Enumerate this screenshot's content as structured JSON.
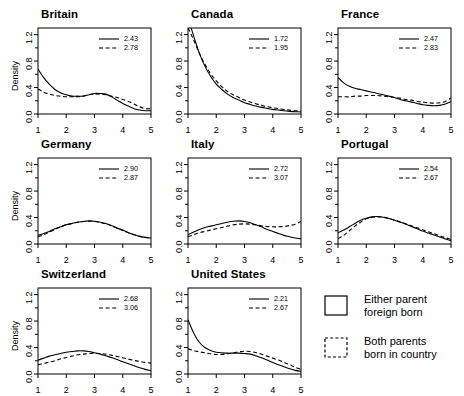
{
  "figure": {
    "layout": "3x3 small multiples",
    "panel_order": [
      "Britain",
      "Canada",
      "France",
      "Germany",
      "Italy",
      "Portugal",
      "Switzerland",
      "United States"
    ],
    "ylabel": "Density",
    "y_ticks": [
      "0.0",
      "0.4",
      "0.8",
      "1.2"
    ],
    "x_ticks": [
      "1",
      "2",
      "3",
      "4",
      "5"
    ]
  },
  "key": {
    "solid_label_line1": "Either parent",
    "solid_label_line2": "foreign born",
    "dashed_label_line1": "Both parents",
    "dashed_label_line2": "born in country"
  },
  "panels": [
    {
      "title": "Britain",
      "solid_value": "2.43",
      "dashed_value": "2.78"
    },
    {
      "title": "Canada",
      "solid_value": "1.72",
      "dashed_value": "1.95"
    },
    {
      "title": "France",
      "solid_value": "2.47",
      "dashed_value": "2.83"
    },
    {
      "title": "Germany",
      "solid_value": "2.90",
      "dashed_value": "2.87"
    },
    {
      "title": "Italy",
      "solid_value": "2.72",
      "dashed_value": "3.07"
    },
    {
      "title": "Portugal",
      "solid_value": "2.54",
      "dashed_value": "2.67"
    },
    {
      "title": "Switzerland",
      "solid_value": "2.68",
      "dashed_value": "3.06"
    },
    {
      "title": "United States",
      "solid_value": "2.21",
      "dashed_value": "2.67"
    }
  ],
  "chart_data": {
    "type": "line",
    "title": "",
    "xlabel": "",
    "ylabel": "Density",
    "xlim": [
      1,
      5
    ],
    "ylim": [
      0,
      1.3
    ],
    "x_ticks": [
      1,
      2,
      3,
      4,
      5
    ],
    "y_ticks": [
      0.0,
      0.4,
      0.8,
      1.2
    ],
    "grid": false,
    "legend_position": "inside-top-right (per panel, numeric means)",
    "series_names": [
      "Either parent foreign born",
      "Both parents born in country"
    ],
    "x": [
      1.0,
      1.2,
      1.4,
      1.6,
      1.8,
      2.0,
      2.2,
      2.4,
      2.6,
      2.8,
      3.0,
      3.2,
      3.4,
      3.6,
      3.8,
      4.0,
      4.2,
      4.4,
      4.6,
      4.8,
      5.0
    ],
    "panels": [
      {
        "title": "Britain",
        "mean_solid": 2.43,
        "mean_dashed": 2.78,
        "series": [
          {
            "name": "Either parent foreign born",
            "style": "solid",
            "values": [
              0.68,
              0.55,
              0.45,
              0.37,
              0.32,
              0.29,
              0.27,
              0.27,
              0.27,
              0.29,
              0.31,
              0.31,
              0.3,
              0.26,
              0.21,
              0.16,
              0.12,
              0.08,
              0.06,
              0.05,
              0.05
            ]
          },
          {
            "name": "Both parents born in country",
            "style": "dashed",
            "values": [
              0.38,
              0.33,
              0.3,
              0.28,
              0.27,
              0.26,
              0.26,
              0.26,
              0.27,
              0.29,
              0.3,
              0.3,
              0.29,
              0.27,
              0.25,
              0.22,
              0.19,
              0.15,
              0.11,
              0.08,
              0.08
            ]
          }
        ]
      },
      {
        "title": "Canada",
        "mean_solid": 1.72,
        "mean_dashed": 1.95,
        "series": [
          {
            "name": "Either parent foreign born",
            "style": "solid",
            "values": [
              1.45,
              1.18,
              0.92,
              0.72,
              0.57,
              0.45,
              0.37,
              0.3,
              0.25,
              0.21,
              0.17,
              0.145,
              0.12,
              0.1,
              0.085,
              0.07,
              0.06,
              0.05,
              0.04,
              0.035,
              0.03
            ]
          },
          {
            "name": "Both parents born in country",
            "style": "dashed",
            "values": [
              1.3,
              1.12,
              0.92,
              0.75,
              0.61,
              0.5,
              0.41,
              0.34,
              0.29,
              0.25,
              0.21,
              0.18,
              0.155,
              0.13,
              0.11,
              0.095,
              0.08,
              0.068,
              0.058,
              0.05,
              0.045
            ]
          }
        ]
      },
      {
        "title": "France",
        "mean_solid": 2.47,
        "mean_dashed": 2.83,
        "series": [
          {
            "name": "Either parent foreign born",
            "style": "solid",
            "values": [
              0.55,
              0.47,
              0.42,
              0.39,
              0.37,
              0.35,
              0.33,
              0.31,
              0.29,
              0.27,
              0.25,
              0.22,
              0.2,
              0.18,
              0.16,
              0.14,
              0.13,
              0.125,
              0.13,
              0.15,
              0.19
            ]
          },
          {
            "name": "Both parents born in country",
            "style": "dashed",
            "values": [
              0.26,
              0.26,
              0.26,
              0.27,
              0.27,
              0.28,
              0.28,
              0.28,
              0.27,
              0.26,
              0.25,
              0.24,
              0.22,
              0.21,
              0.19,
              0.18,
              0.17,
              0.165,
              0.17,
              0.19,
              0.24
            ]
          }
        ]
      },
      {
        "title": "Germany",
        "mean_solid": 2.9,
        "mean_dashed": 2.87,
        "series": [
          {
            "name": "Either parent foreign born",
            "style": "solid",
            "values": [
              0.13,
              0.16,
              0.19,
              0.23,
              0.26,
              0.29,
              0.31,
              0.33,
              0.34,
              0.35,
              0.345,
              0.33,
              0.31,
              0.28,
              0.24,
              0.21,
              0.17,
              0.14,
              0.115,
              0.1,
              0.09
            ]
          },
          {
            "name": "Both parents born in country",
            "style": "dashed",
            "values": [
              0.11,
              0.14,
              0.18,
              0.22,
              0.26,
              0.29,
              0.31,
              0.33,
              0.34,
              0.345,
              0.34,
              0.325,
              0.305,
              0.275,
              0.24,
              0.205,
              0.17,
              0.14,
              0.115,
              0.1,
              0.09
            ]
          }
        ]
      },
      {
        "title": "Italy",
        "mean_solid": 2.72,
        "mean_dashed": 3.07,
        "series": [
          {
            "name": "Either parent foreign born",
            "style": "solid",
            "values": [
              0.14,
              0.18,
              0.22,
              0.25,
              0.27,
              0.29,
              0.31,
              0.33,
              0.345,
              0.35,
              0.34,
              0.32,
              0.29,
              0.26,
              0.22,
              0.19,
              0.16,
              0.13,
              0.11,
              0.09,
              0.08
            ]
          },
          {
            "name": "Both parents born in country",
            "style": "dashed",
            "values": [
              0.11,
              0.14,
              0.17,
              0.19,
              0.21,
              0.23,
              0.25,
              0.27,
              0.29,
              0.3,
              0.305,
              0.3,
              0.29,
              0.275,
              0.265,
              0.26,
              0.26,
              0.265,
              0.28,
              0.3,
              0.34
            ]
          }
        ]
      },
      {
        "title": "Portugal",
        "mean_solid": 2.54,
        "mean_dashed": 2.67,
        "series": [
          {
            "name": "Either parent foreign born",
            "style": "solid",
            "values": [
              0.17,
              0.21,
              0.26,
              0.31,
              0.36,
              0.39,
              0.41,
              0.415,
              0.405,
              0.385,
              0.36,
              0.33,
              0.3,
              0.265,
              0.23,
              0.195,
              0.165,
              0.135,
              0.105,
              0.075,
              0.05
            ]
          },
          {
            "name": "Both parents born in country",
            "style": "dashed",
            "values": [
              0.08,
              0.13,
              0.2,
              0.27,
              0.33,
              0.38,
              0.405,
              0.41,
              0.405,
              0.385,
              0.36,
              0.335,
              0.305,
              0.275,
              0.245,
              0.215,
              0.185,
              0.155,
              0.125,
              0.095,
              0.07
            ]
          }
        ]
      },
      {
        "title": "Switzerland",
        "mean_solid": 2.68,
        "mean_dashed": 3.06,
        "series": [
          {
            "name": "Either parent foreign born",
            "style": "solid",
            "values": [
              0.21,
              0.24,
              0.27,
              0.29,
              0.31,
              0.33,
              0.34,
              0.35,
              0.35,
              0.34,
              0.32,
              0.3,
              0.275,
              0.25,
              0.22,
              0.185,
              0.155,
              0.125,
              0.095,
              0.07,
              0.05
            ]
          },
          {
            "name": "Both parents born in country",
            "style": "dashed",
            "values": [
              0.14,
              0.16,
              0.18,
              0.2,
              0.23,
              0.25,
              0.27,
              0.29,
              0.3,
              0.31,
              0.315,
              0.31,
              0.3,
              0.285,
              0.265,
              0.245,
              0.225,
              0.205,
              0.19,
              0.175,
              0.165
            ]
          }
        ]
      },
      {
        "title": "United States",
        "mean_solid": 2.21,
        "mean_dashed": 2.67,
        "series": [
          {
            "name": "Either parent foreign born",
            "style": "solid",
            "values": [
              0.82,
              0.62,
              0.48,
              0.4,
              0.355,
              0.33,
              0.32,
              0.315,
              0.315,
              0.315,
              0.31,
              0.3,
              0.275,
              0.245,
              0.21,
              0.175,
              0.14,
              0.11,
              0.08,
              0.055,
              0.04
            ]
          },
          {
            "name": "Both parents born in country",
            "style": "dashed",
            "values": [
              0.38,
              0.355,
              0.335,
              0.32,
              0.305,
              0.295,
              0.295,
              0.305,
              0.32,
              0.335,
              0.345,
              0.34,
              0.325,
              0.3,
              0.27,
              0.24,
              0.21,
              0.175,
              0.14,
              0.1,
              0.07
            ]
          }
        ]
      }
    ]
  }
}
